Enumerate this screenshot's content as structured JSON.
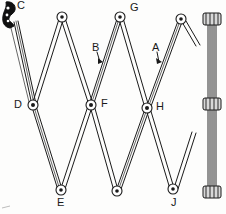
{
  "figure": {
    "type": "patent-line-drawing",
    "width": 226,
    "height": 214,
    "background_color": "#fdfdfc",
    "ink_color": "#1a1a1a"
  },
  "labels": {
    "a": "A",
    "b": "B",
    "c": "C",
    "d": "D",
    "e": "E",
    "f": "F",
    "g": "G",
    "h": "H",
    "j": "J"
  },
  "label_positions": {
    "a": {
      "x": 152,
      "y": 43
    },
    "b": {
      "x": 92,
      "y": 43
    },
    "c": {
      "x": 17,
      "y": 1
    },
    "d": {
      "x": 14,
      "y": 99
    },
    "e": {
      "x": 57,
      "y": 198
    },
    "f": {
      "x": 101,
      "y": 98
    },
    "g": {
      "x": 129,
      "y": 4
    },
    "h": {
      "x": 155,
      "y": 102
    },
    "j": {
      "x": 172,
      "y": 198
    }
  },
  "pivots": [
    {
      "name": "pivot-g",
      "x": 61,
      "y": 17,
      "label": ""
    },
    {
      "name": "pivot-g-top",
      "x": 119,
      "y": 17,
      "label": "G"
    },
    {
      "name": "pivot-top-right",
      "x": 180,
      "y": 19,
      "label": ""
    },
    {
      "name": "pivot-d",
      "x": 32,
      "y": 105,
      "label": "D"
    },
    {
      "name": "pivot-f",
      "x": 90,
      "y": 105,
      "label": "F"
    },
    {
      "name": "pivot-h",
      "x": 146,
      "y": 108,
      "label": "H"
    },
    {
      "name": "pivot-e",
      "x": 60,
      "y": 191,
      "label": "E"
    },
    {
      "name": "pivot-bottom-mid",
      "x": 116,
      "y": 191,
      "label": ""
    },
    {
      "name": "pivot-j",
      "x": 172,
      "y": 190,
      "label": "J"
    }
  ],
  "vertical_rod": {
    "name": "vertical-rod",
    "x": 212,
    "top_y": 16,
    "bottom_y": 197,
    "collars": [
      20,
      104,
      192
    ]
  },
  "arrows": {
    "a_points_to": "link-bar-A",
    "b_points_to": "link-bar-B"
  },
  "handle": {
    "name": "handle-grip",
    "description": "dark serrated grip at upper-left terminating link C"
  }
}
